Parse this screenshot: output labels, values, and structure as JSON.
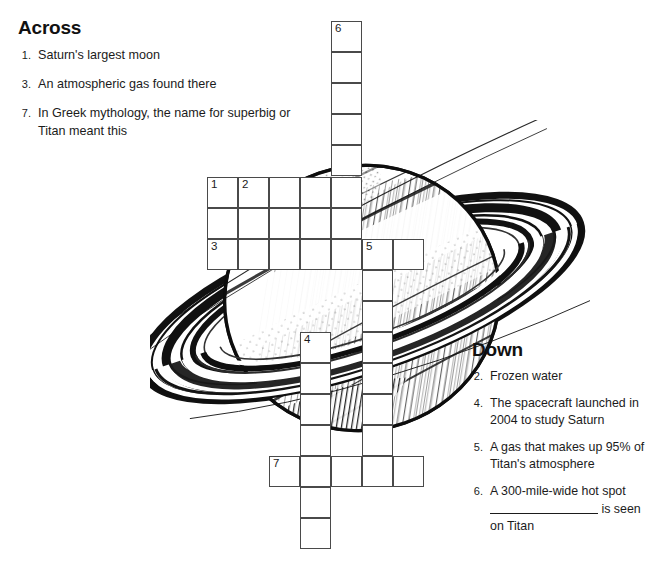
{
  "page": {
    "background_color": "#ffffff",
    "ink_color": "#1b1b1b",
    "grid_line_color": "#4a4a4a"
  },
  "across": {
    "heading": "Across",
    "clues": [
      {
        "number": "1.",
        "text": "Saturn's largest moon"
      },
      {
        "number": "3.",
        "text": "An atmospheric gas found there"
      },
      {
        "number": "7.",
        "text": "In Greek mythology, the name for superbig or Titan meant this"
      }
    ]
  },
  "down": {
    "heading": "Down",
    "clues": [
      {
        "number": "2.",
        "text": "Frozen water"
      },
      {
        "number": "4.",
        "text": "The spacecraft launched in 2004 to study Saturn"
      },
      {
        "number": "5.",
        "text": "A gas that makes up 95% of Titan's atmosphere"
      },
      {
        "number": "6.",
        "text_before": "A 300-mile-wide hot spot",
        "text_after": "is seen on Titan",
        "has_blank": true
      }
    ]
  },
  "copyright": {
    "text": "Copyright © 2007 by Julia Farish Spencer, Ph.D."
  },
  "illustration": {
    "name": "saturn-with-rings",
    "description": "Black and white pen-and-ink drawing of the planet Saturn with its ring system"
  },
  "grid": {
    "cell_size": 31,
    "cells": [
      {
        "x": 331,
        "y": 21,
        "number": "6"
      },
      {
        "x": 331,
        "y": 52,
        "number": ""
      },
      {
        "x": 331,
        "y": 83,
        "number": ""
      },
      {
        "x": 331,
        "y": 114,
        "number": ""
      },
      {
        "x": 331,
        "y": 145,
        "number": ""
      },
      {
        "x": 207,
        "y": 177,
        "number": "1"
      },
      {
        "x": 238,
        "y": 177,
        "number": "2"
      },
      {
        "x": 269,
        "y": 177,
        "number": ""
      },
      {
        "x": 300,
        "y": 177,
        "number": ""
      },
      {
        "x": 331,
        "y": 177,
        "number": ""
      },
      {
        "x": 207,
        "y": 208,
        "number": ""
      },
      {
        "x": 238,
        "y": 208,
        "number": ""
      },
      {
        "x": 269,
        "y": 208,
        "number": ""
      },
      {
        "x": 300,
        "y": 208,
        "number": ""
      },
      {
        "x": 331,
        "y": 208,
        "number": ""
      },
      {
        "x": 207,
        "y": 239,
        "number": "3"
      },
      {
        "x": 238,
        "y": 239,
        "number": ""
      },
      {
        "x": 269,
        "y": 239,
        "number": ""
      },
      {
        "x": 300,
        "y": 239,
        "number": ""
      },
      {
        "x": 331,
        "y": 239,
        "number": ""
      },
      {
        "x": 362,
        "y": 239,
        "number": "5"
      },
      {
        "x": 393,
        "y": 239,
        "number": ""
      },
      {
        "x": 362,
        "y": 270,
        "number": ""
      },
      {
        "x": 362,
        "y": 301,
        "number": ""
      },
      {
        "x": 300,
        "y": 332,
        "number": "4"
      },
      {
        "x": 362,
        "y": 332,
        "number": ""
      },
      {
        "x": 300,
        "y": 363,
        "number": ""
      },
      {
        "x": 362,
        "y": 363,
        "number": ""
      },
      {
        "x": 300,
        "y": 394,
        "number": ""
      },
      {
        "x": 362,
        "y": 394,
        "number": ""
      },
      {
        "x": 300,
        "y": 425,
        "number": ""
      },
      {
        "x": 362,
        "y": 425,
        "number": ""
      },
      {
        "x": 269,
        "y": 456,
        "number": "7"
      },
      {
        "x": 300,
        "y": 456,
        "number": ""
      },
      {
        "x": 331,
        "y": 456,
        "number": ""
      },
      {
        "x": 362,
        "y": 456,
        "number": ""
      },
      {
        "x": 393,
        "y": 456,
        "number": ""
      },
      {
        "x": 300,
        "y": 487,
        "number": ""
      },
      {
        "x": 300,
        "y": 518,
        "number": ""
      }
    ]
  }
}
